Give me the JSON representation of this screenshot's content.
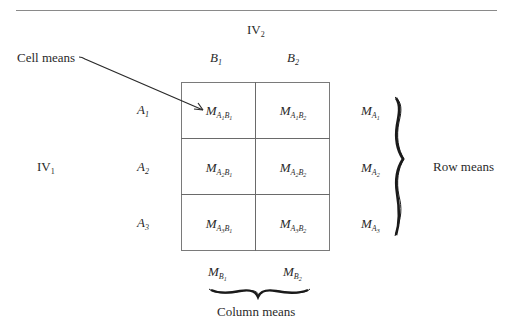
{
  "labels": {
    "iv2": "IV",
    "iv2_sub": "2",
    "iv1": "IV",
    "iv1_sub": "1",
    "cell_means": "Cell means",
    "row_means": "Row means",
    "column_means": "Column means"
  },
  "columns": [
    {
      "letter": "B",
      "sub": "1"
    },
    {
      "letter": "B",
      "sub": "2"
    }
  ],
  "rows": [
    {
      "letter": "A",
      "sub": "1"
    },
    {
      "letter": "A",
      "sub": "2"
    },
    {
      "letter": "A",
      "sub": "3"
    }
  ],
  "cells": [
    [
      {
        "m": "M",
        "a": "A",
        "as": "1",
        "b": "B",
        "bs": "1"
      },
      {
        "m": "M",
        "a": "A",
        "as": "1",
        "b": "B",
        "bs": "2"
      }
    ],
    [
      {
        "m": "M",
        "a": "A",
        "as": "2",
        "b": "B",
        "bs": "1"
      },
      {
        "m": "M",
        "a": "A",
        "as": "2",
        "b": "B",
        "bs": "2"
      }
    ],
    [
      {
        "m": "M",
        "a": "A",
        "as": "3",
        "b": "B",
        "bs": "1"
      },
      {
        "m": "M",
        "a": "A",
        "as": "3",
        "b": "B",
        "bs": "2"
      }
    ]
  ],
  "row_means": [
    {
      "m": "M",
      "sub": "A",
      "subsub": "1"
    },
    {
      "m": "M",
      "sub": "A",
      "subsub": "2"
    },
    {
      "m": "M",
      "sub": "A",
      "subsub": "3"
    }
  ],
  "column_means": [
    {
      "m": "M",
      "sub": "B",
      "subsub": "1"
    },
    {
      "m": "M",
      "sub": "B",
      "subsub": "2"
    }
  ]
}
